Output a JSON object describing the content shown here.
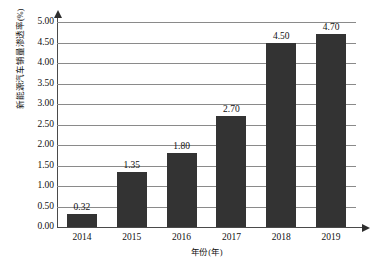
{
  "chart_data": {
    "type": "bar",
    "title": "",
    "xlabel": "年份(年)",
    "ylabel": "新能源汽车销量渗透率(%)",
    "categories": [
      "2014",
      "2015",
      "2016",
      "2017",
      "2018",
      "2019"
    ],
    "values": [
      0.32,
      1.35,
      1.8,
      2.7,
      4.5,
      4.7
    ],
    "value_labels": [
      "0.32",
      "1.35",
      "1.80",
      "2.70",
      "4.50",
      "4.70"
    ],
    "ylim": [
      0,
      5
    ],
    "ytick_labels": [
      "0.00",
      "0.50",
      "1.00",
      "1.50",
      "2.00",
      "2.50",
      "3.00",
      "3.50",
      "4.00",
      "4.50",
      "5.00"
    ],
    "ytick_values": [
      0,
      0.5,
      1,
      1.5,
      2,
      2.5,
      3,
      3.5,
      4,
      4.5,
      5
    ],
    "grid": true,
    "legend": false,
    "legend_position": "none",
    "series": [
      {
        "name": "新能源汽车销量渗透率(%)",
        "values": [
          0.32,
          1.35,
          1.8,
          2.7,
          4.5,
          4.7
        ]
      }
    ],
    "colors": {
      "bar": "#333333",
      "gridline": "#8a8a8a",
      "axis": "#4a4a4a",
      "text": "#111111",
      "background": "#ffffff"
    }
  }
}
